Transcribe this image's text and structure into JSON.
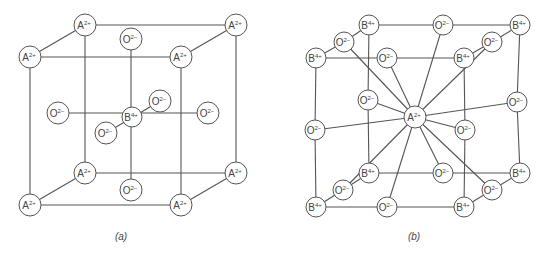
{
  "figure": {
    "colors": {
      "line": "#555555",
      "text": "#444444",
      "background": "#ffffff"
    },
    "panels": [
      {
        "id": "a",
        "label": "(a)",
        "label_pos": [
          121,
          240
        ],
        "radius": 11,
        "atoms": [
          {
            "id": "a1",
            "el": "A",
            "charge": "2+",
            "x": 85,
            "y": 25
          },
          {
            "id": "a2",
            "el": "A",
            "charge": "2+",
            "x": 236,
            "y": 25
          },
          {
            "id": "a3",
            "el": "A",
            "charge": "2+",
            "x": 30,
            "y": 57
          },
          {
            "id": "a4",
            "el": "A",
            "charge": "2+",
            "x": 181,
            "y": 57
          },
          {
            "id": "a5",
            "el": "O",
            "charge": "2−",
            "x": 131,
            "y": 39
          },
          {
            "id": "a6",
            "el": "O",
            "charge": "2−",
            "x": 58,
            "y": 113
          },
          {
            "id": "a7",
            "el": "B",
            "charge": "4+",
            "x": 132,
            "y": 117,
            "r": 10
          },
          {
            "id": "a8",
            "el": "O",
            "charge": "2−",
            "x": 160,
            "y": 101
          },
          {
            "id": "a9",
            "el": "O",
            "charge": "2−",
            "x": 208,
            "y": 113
          },
          {
            "id": "a10",
            "el": "O",
            "charge": "2−",
            "x": 106,
            "y": 133
          },
          {
            "id": "a11",
            "el": "A",
            "charge": "2+",
            "x": 85,
            "y": 173
          },
          {
            "id": "a12",
            "el": "A",
            "charge": "2+",
            "x": 236,
            "y": 173
          },
          {
            "id": "a13",
            "el": "A",
            "charge": "2+",
            "x": 30,
            "y": 205
          },
          {
            "id": "a14",
            "el": "A",
            "charge": "2+",
            "x": 181,
            "y": 205
          },
          {
            "id": "a15",
            "el": "O",
            "charge": "2−",
            "x": 131,
            "y": 190
          }
        ],
        "bonds": [
          [
            "a1",
            "a2"
          ],
          [
            "a3",
            "a4"
          ],
          [
            "a1",
            "a3"
          ],
          [
            "a2",
            "a4"
          ],
          [
            "a11",
            "a12"
          ],
          [
            "a13",
            "a14"
          ],
          [
            "a11",
            "a13"
          ],
          [
            "a12",
            "a14"
          ],
          [
            "a1",
            "a11"
          ],
          [
            "a2",
            "a12"
          ],
          [
            "a3",
            "a13"
          ],
          [
            "a4",
            "a14"
          ],
          [
            "a5",
            "a15"
          ],
          [
            "a6",
            "a9"
          ],
          [
            "a8",
            "a10"
          ]
        ]
      },
      {
        "id": "b",
        "label": "(b)",
        "label_pos": [
          414,
          240
        ],
        "radius": 10,
        "atoms": [
          {
            "id": "b1",
            "el": "B",
            "charge": "4+",
            "x": 369,
            "y": 25
          },
          {
            "id": "b2",
            "el": "O",
            "charge": "2−",
            "x": 443,
            "y": 25
          },
          {
            "id": "b3",
            "el": "B",
            "charge": "4+",
            "x": 520,
            "y": 25
          },
          {
            "id": "b4",
            "el": "O",
            "charge": "2−",
            "x": 344,
            "y": 42
          },
          {
            "id": "b5",
            "el": "O",
            "charge": "2−",
            "x": 492,
            "y": 42
          },
          {
            "id": "b6",
            "el": "B",
            "charge": "4+",
            "x": 316,
            "y": 58
          },
          {
            "id": "b7",
            "el": "O",
            "charge": "2−",
            "x": 387,
            "y": 58
          },
          {
            "id": "b8",
            "el": "B",
            "charge": "4+",
            "x": 464,
            "y": 58
          },
          {
            "id": "b9",
            "el": "O",
            "charge": "2−",
            "x": 368,
            "y": 100
          },
          {
            "id": "b10",
            "el": "O",
            "charge": "2−",
            "x": 517,
            "y": 102
          },
          {
            "id": "b11",
            "el": "A",
            "charge": "2+",
            "x": 415,
            "y": 117,
            "r": 11
          },
          {
            "id": "b12",
            "el": "O",
            "charge": "2−",
            "x": 315,
            "y": 130
          },
          {
            "id": "b13",
            "el": "O",
            "charge": "2−",
            "x": 465,
            "y": 130
          },
          {
            "id": "b14",
            "el": "B",
            "charge": "4+",
            "x": 369,
            "y": 173
          },
          {
            "id": "b15",
            "el": "O",
            "charge": "2−",
            "x": 443,
            "y": 173
          },
          {
            "id": "b16",
            "el": "B",
            "charge": "4+",
            "x": 520,
            "y": 173
          },
          {
            "id": "b17",
            "el": "O",
            "charge": "2−",
            "x": 343,
            "y": 190
          },
          {
            "id": "b18",
            "el": "O",
            "charge": "2−",
            "x": 492,
            "y": 190
          },
          {
            "id": "b19",
            "el": "B",
            "charge": "4+",
            "x": 316,
            "y": 207
          },
          {
            "id": "b20",
            "el": "O",
            "charge": "2−",
            "x": 387,
            "y": 207
          },
          {
            "id": "b21",
            "el": "B",
            "charge": "4+",
            "x": 464,
            "y": 207
          }
        ],
        "bonds": [
          [
            "b1",
            "b2"
          ],
          [
            "b2",
            "b3"
          ],
          [
            "b6",
            "b7"
          ],
          [
            "b7",
            "b8"
          ],
          [
            "b1",
            "b4"
          ],
          [
            "b4",
            "b6"
          ],
          [
            "b3",
            "b5"
          ],
          [
            "b5",
            "b8"
          ],
          [
            "b14",
            "b15"
          ],
          [
            "b15",
            "b16"
          ],
          [
            "b19",
            "b20"
          ],
          [
            "b20",
            "b21"
          ],
          [
            "b14",
            "b17"
          ],
          [
            "b17",
            "b19"
          ],
          [
            "b16",
            "b18"
          ],
          [
            "b18",
            "b21"
          ],
          [
            "b1",
            "b9"
          ],
          [
            "b9",
            "b14"
          ],
          [
            "b3",
            "b10"
          ],
          [
            "b10",
            "b16"
          ],
          [
            "b6",
            "b12"
          ],
          [
            "b12",
            "b19"
          ],
          [
            "b8",
            "b13"
          ],
          [
            "b13",
            "b21"
          ],
          [
            "b11",
            "b2"
          ],
          [
            "b11",
            "b4"
          ],
          [
            "b11",
            "b5"
          ],
          [
            "b11",
            "b9"
          ],
          [
            "b11",
            "b10"
          ],
          [
            "b11",
            "b12"
          ],
          [
            "b11",
            "b13"
          ],
          [
            "b11",
            "b15"
          ],
          [
            "b11",
            "b17"
          ],
          [
            "b11",
            "b18"
          ],
          [
            "b11",
            "b20"
          ],
          [
            "b11",
            "b7"
          ]
        ]
      }
    ]
  }
}
